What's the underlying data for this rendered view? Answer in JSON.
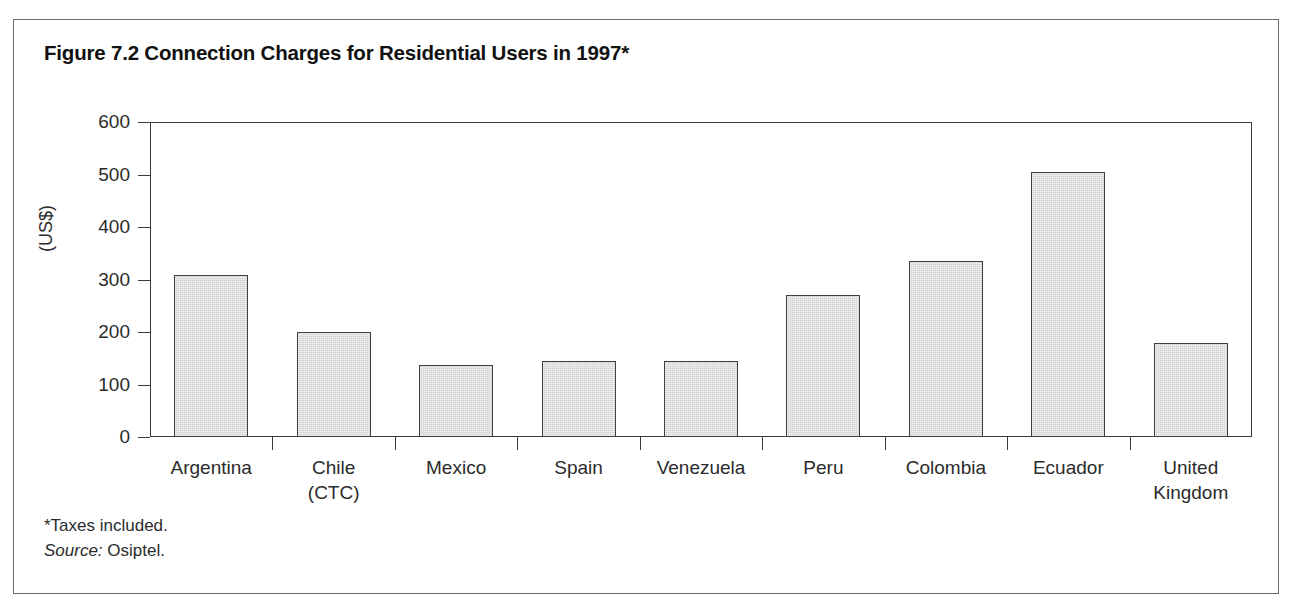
{
  "figure": {
    "title": "Figure 7.2 Connection Charges for Residential Users in 1997*",
    "note_taxes": "*Taxes included.",
    "note_source_prefix": "Source:",
    "note_source_value": "Osiptel.",
    "frame_color": "#6b6b6b",
    "bar_fill": "#d2d2d2",
    "bar_stroke": "#3f3f3f",
    "axis_color": "#3a3a3a"
  },
  "chart_data": {
    "type": "bar",
    "title": "Figure 7.2 Connection Charges for Residential Users in 1997*",
    "xlabel": "",
    "ylabel": "(US$)",
    "ylim": [
      0,
      600
    ],
    "yticks": [
      0,
      100,
      200,
      300,
      400,
      500,
      600
    ],
    "ytick_labels": [
      "0",
      "100",
      "200",
      "300",
      "400",
      "500",
      "600"
    ],
    "grid": false,
    "legend": null,
    "categories": [
      "Argentina",
      "Chile (CTC)",
      "Mexico",
      "Spain",
      "Venezuela",
      "Peru",
      "Colombia",
      "Ecuador",
      "United Kingdom"
    ],
    "category_lines": [
      [
        "Argentina"
      ],
      [
        "Chile",
        "(CTC)"
      ],
      [
        "Mexico"
      ],
      [
        "Spain"
      ],
      [
        "Venezuela"
      ],
      [
        "Peru"
      ],
      [
        "Colombia"
      ],
      [
        "Ecuador"
      ],
      [
        "United",
        "Kingdom"
      ]
    ],
    "values": [
      308,
      200,
      137,
      145,
      145,
      270,
      335,
      505,
      180
    ],
    "units": "US$",
    "annotations": [
      "*Taxes included.",
      "Source: Osiptel."
    ]
  }
}
